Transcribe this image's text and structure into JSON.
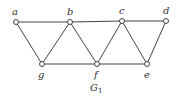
{
  "diagram": {
    "caption": "G",
    "caption_subscript": "1",
    "nodes": [
      {
        "id": "a",
        "label": "a"
      },
      {
        "id": "b",
        "label": "b"
      },
      {
        "id": "c",
        "label": "c"
      },
      {
        "id": "d",
        "label": "d"
      },
      {
        "id": "g",
        "label": "g"
      },
      {
        "id": "f",
        "label": "f"
      },
      {
        "id": "e",
        "label": "e"
      }
    ],
    "edges": [
      [
        "a",
        "b"
      ],
      [
        "b",
        "c"
      ],
      [
        "c",
        "d"
      ],
      [
        "a",
        "g"
      ],
      [
        "g",
        "b"
      ],
      [
        "b",
        "f"
      ],
      [
        "f",
        "c"
      ],
      [
        "c",
        "e"
      ],
      [
        "e",
        "d"
      ],
      [
        "g",
        "f"
      ],
      [
        "f",
        "e"
      ]
    ]
  }
}
